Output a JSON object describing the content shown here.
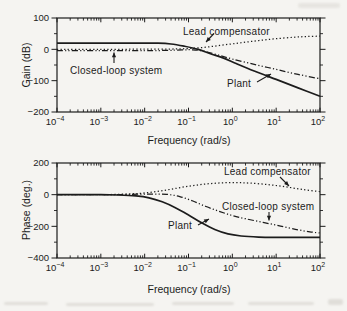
{
  "figure": {
    "background": "#f5f4f1",
    "ink": "#1c1c1c"
  },
  "chart_data": [
    {
      "type": "line",
      "title": "",
      "xlabel": "Frequency (rad/s)",
      "ylabel": "Gain (dB)",
      "x_scale": "log10",
      "xlim_log10": [
        -4,
        2
      ],
      "xtick_exponents": [
        -4,
        -3,
        -2,
        -1,
        0,
        1,
        2
      ],
      "ylim": [
        -200,
        100
      ],
      "yticks": [
        100,
        0,
        -100,
        -200
      ],
      "yminorticks": [
        50,
        -50,
        -150
      ],
      "grid": false,
      "legend": "inline-annotations",
      "series": [
        {
          "name": "Plant",
          "style": "solid",
          "points": [
            [
              -4,
              20
            ],
            [
              -3,
              20
            ],
            [
              -2.2,
              20
            ],
            [
              -1.7,
              19.5
            ],
            [
              -1.4,
              17
            ],
            [
              -1.1,
              10
            ],
            [
              -0.78,
              0
            ],
            [
              -0.5,
              -14
            ],
            [
              -0.2,
              -28
            ],
            [
              0.1,
              -46
            ],
            [
              0.5,
              -69
            ],
            [
              1,
              -96
            ],
            [
              1.5,
              -123
            ],
            [
              2,
              -150
            ]
          ]
        },
        {
          "name": "Closed-loop system",
          "style": "dashdot",
          "points": [
            [
              -4,
              -4
            ],
            [
              -3,
              -4
            ],
            [
              -2,
              -4
            ],
            [
              -1.5,
              -3.5
            ],
            [
              -1.15,
              -2
            ],
            [
              -0.9,
              -1.5
            ],
            [
              -0.65,
              -6
            ],
            [
              -0.35,
              -17
            ],
            [
              0,
              -31
            ],
            [
              0.5,
              -48
            ],
            [
              1,
              -64
            ],
            [
              1.5,
              -80
            ],
            [
              2,
              -94
            ]
          ]
        },
        {
          "name": "Lead compensator",
          "style": "dotted",
          "points": [
            [
              -4,
              0
            ],
            [
              -3,
              0
            ],
            [
              -2,
              0.5
            ],
            [
              -1.4,
              1
            ],
            [
              -1,
              2.5
            ],
            [
              -0.6,
              7
            ],
            [
              -0.2,
              14
            ],
            [
              0.2,
              21
            ],
            [
              0.6,
              28
            ],
            [
              1,
              34
            ],
            [
              1.4,
              38.5
            ],
            [
              1.7,
              41
            ],
            [
              2,
              42
            ]
          ]
        }
      ],
      "annotations": [
        {
          "label": "Lead compensator",
          "text_px": [
            183,
            31
          ],
          "arrow_from_px": [
            214,
            33.5
          ],
          "arrow_to_px": [
            206,
            42
          ]
        },
        {
          "label": "Closed-loop system",
          "text_px": [
            70,
            70
          ],
          "arrow_from_px": [
            114,
            63
          ],
          "arrow_to_px": [
            114,
            52.5
          ]
        },
        {
          "label": "Plant",
          "text_px": [
            227,
            83
          ],
          "arrow_from_px": [
            257,
            82
          ],
          "arrow_to_px": [
            271,
            74
          ]
        }
      ]
    },
    {
      "type": "line",
      "title": "",
      "xlabel": "Frequency (rad/s)",
      "ylabel": "Phase (deg.)",
      "x_scale": "log10",
      "xlim_log10": [
        -4,
        2
      ],
      "xtick_exponents": [
        -4,
        -3,
        -2,
        -1,
        0,
        1,
        2
      ],
      "ylim": [
        -400,
        200
      ],
      "yticks": [
        200,
        0,
        -200,
        -400
      ],
      "yminorticks": [
        100,
        -100,
        -300
      ],
      "grid": false,
      "legend": "inline-annotations",
      "series": [
        {
          "name": "Plant",
          "style": "solid",
          "points": [
            [
              -4,
              0
            ],
            [
              -3,
              0
            ],
            [
              -2.6,
              -2
            ],
            [
              -2.2,
              -8
            ],
            [
              -1.9,
              -20
            ],
            [
              -1.6,
              -45
            ],
            [
              -1.3,
              -82
            ],
            [
              -1,
              -128
            ],
            [
              -0.7,
              -178
            ],
            [
              -0.4,
              -220
            ],
            [
              -0.1,
              -248
            ],
            [
              0.2,
              -261
            ],
            [
              0.6,
              -268
            ],
            [
              1,
              -270
            ],
            [
              1.5,
              -270
            ],
            [
              2,
              -270
            ]
          ]
        },
        {
          "name": "Closed-loop system",
          "style": "dashdot",
          "points": [
            [
              -4,
              0
            ],
            [
              -3,
              0
            ],
            [
              -2.5,
              1
            ],
            [
              -2.1,
              3
            ],
            [
              -1.8,
              4
            ],
            [
              -1.5,
              2
            ],
            [
              -1.2,
              -12
            ],
            [
              -0.9,
              -40
            ],
            [
              -0.6,
              -75
            ],
            [
              -0.3,
              -105
            ],
            [
              0,
              -132
            ],
            [
              0.3,
              -152
            ],
            [
              0.7,
              -175
            ],
            [
              1.1,
              -198
            ],
            [
              1.5,
              -222
            ],
            [
              1.8,
              -236
            ],
            [
              2,
              -242
            ]
          ]
        },
        {
          "name": "Lead compensator",
          "style": "dotted",
          "points": [
            [
              -4,
              0
            ],
            [
              -3,
              0
            ],
            [
              -2.7,
              1.5
            ],
            [
              -2.3,
              5
            ],
            [
              -2,
              11
            ],
            [
              -1.7,
              21
            ],
            [
              -1.4,
              34
            ],
            [
              -1.1,
              49
            ],
            [
              -0.8,
              61
            ],
            [
              -0.5,
              70
            ],
            [
              -0.2,
              75
            ],
            [
              0.1,
              76
            ],
            [
              0.4,
              73
            ],
            [
              0.8,
              64
            ],
            [
              1.2,
              50
            ],
            [
              1.6,
              33
            ],
            [
              2,
              19
            ]
          ]
        }
      ],
      "annotations": [
        {
          "label": "Lead compensator",
          "text_px": [
            224,
            171
          ],
          "arrow_from_px": [
            280,
            177
          ],
          "arrow_to_px": [
            289,
            186
          ]
        },
        {
          "label": "Closed-loop system",
          "text_px": [
            222,
            206
          ],
          "arrow_from_px": [
            269,
            212
          ],
          "arrow_to_px": [
            269,
            220.5
          ]
        },
        {
          "label": "Plant",
          "text_px": [
            168,
            225
          ],
          "arrow_from_px": [
            198,
            225
          ],
          "arrow_to_px": [
            209,
            219
          ]
        }
      ]
    }
  ],
  "layout": {
    "plot_boxes_px": [
      {
        "left": 57,
        "top": 18,
        "right": 320,
        "bottom": 112
      },
      {
        "left": 57,
        "top": 163,
        "right": 320,
        "bottom": 258
      }
    ]
  }
}
